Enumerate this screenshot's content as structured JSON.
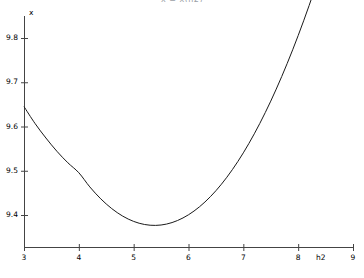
{
  "chart_data": {
    "type": "line",
    "title": "x = x(h2)",
    "xlabel": "h2",
    "ylabel": "x",
    "xlim": [
      3,
      9
    ],
    "ylim": [
      9.33,
      9.87
    ],
    "grid": false,
    "legend": null,
    "xticks": [
      3,
      4,
      5,
      6,
      7,
      8,
      9
    ],
    "xtick_labels": [
      "3",
      "4",
      "5",
      "6",
      "7",
      "8",
      "9"
    ],
    "yticks": [
      9.4,
      9.5,
      9.6,
      9.7,
      9.8
    ],
    "ytick_labels": [
      "9.4",
      "9.5",
      "9.6",
      "9.7",
      "9.8"
    ],
    "line_color": "#1a1a1a",
    "line_width": 1,
    "series": [
      {
        "name": "x",
        "x": [
          3.0,
          3.2,
          3.4,
          3.6,
          3.8,
          4.0,
          4.2,
          4.4,
          4.6,
          4.8,
          5.0,
          5.2,
          5.4,
          5.6,
          5.8,
          6.0,
          6.2,
          6.4,
          6.6,
          6.8,
          7.0,
          7.2,
          7.4,
          7.6,
          7.8,
          8.0,
          8.2,
          8.4,
          8.6,
          8.8,
          9.0
        ],
        "values": [
          9.645,
          9.607,
          9.574,
          9.544,
          9.518,
          9.4955,
          9.4635,
          9.4365,
          9.4145,
          9.3975,
          9.3855,
          9.3785,
          9.3765,
          9.3795,
          9.3875,
          9.4005,
          9.4185,
          9.4415,
          9.4695,
          9.5025,
          9.5405,
          9.5835,
          9.6315,
          9.6845,
          9.7425,
          9.8055,
          9.8735,
          9.9465,
          10.0245,
          10.1075,
          10.1955
        ]
      }
    ],
    "minimum": {
      "x": 5.35,
      "y": 9.376
    }
  },
  "axes": {
    "x_axis_name": "h2-axis",
    "y_axis_name": "x-axis"
  }
}
